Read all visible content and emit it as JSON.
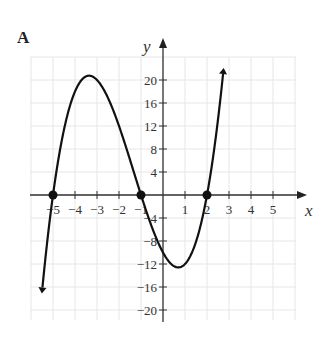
{
  "panel": {
    "label": "A"
  },
  "chart_data": {
    "type": "line",
    "title": "",
    "panel_label": "A",
    "xlabel": "x",
    "ylabel": "y",
    "function": "y = (x+5)(x+1)(x-2) = x^3 + 4x^2 - 7x - 10",
    "xlim": [
      -6,
      6
    ],
    "ylim": [
      -23,
      23
    ],
    "x_ticks": [
      -5,
      -4,
      -3,
      -2,
      -1,
      1,
      2,
      3,
      4,
      5
    ],
    "x_tick_labels": [
      "−5",
      "−4",
      "−3",
      "−2",
      "−1",
      "1",
      "2",
      "3",
      "4",
      "5"
    ],
    "y_ticks": [
      20,
      16,
      12,
      8,
      4,
      -4,
      -8,
      -12,
      -16,
      -20
    ],
    "y_tick_labels": [
      "20",
      "16",
      "12",
      "8",
      "4",
      "−4",
      "−8",
      "−12",
      "−16",
      "−20"
    ],
    "grid": true,
    "series": [
      {
        "name": "cubic",
        "x": [
          -5.3,
          -5,
          -4.5,
          -4,
          -3.5,
          -3.22,
          -3,
          -2.5,
          -2,
          -1.5,
          -1,
          -0.5,
          0,
          0.5,
          0.87,
          1,
          1.5,
          2,
          2.5,
          2.7
        ],
        "y": [
          -5.4,
          0,
          8.1,
          18,
          20.6,
          20.7,
          20,
          16.9,
          12,
          6.4,
          0,
          -5.6,
          -10,
          -12.6,
          -12.6,
          -12,
          -8.1,
          0,
          12.4,
          18.9
        ]
      }
    ],
    "marked_points": [
      {
        "x": -5,
        "y": 0,
        "label": "root"
      },
      {
        "x": -1,
        "y": 0,
        "label": "root"
      },
      {
        "x": 2,
        "y": 0,
        "label": "root"
      }
    ],
    "local_max": {
      "x": -3.2,
      "y": 20.7
    },
    "local_min": {
      "x": 0.9,
      "y": -12.6
    }
  }
}
